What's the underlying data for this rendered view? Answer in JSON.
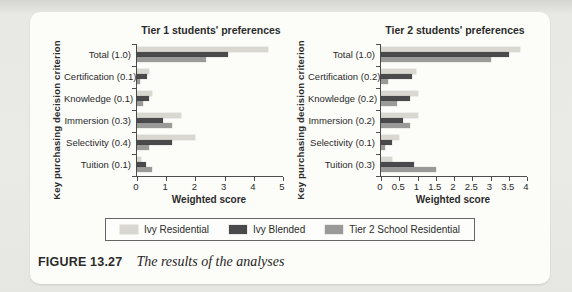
{
  "figure": {
    "label": "FIGURE 13.27",
    "caption": "The results of the analyses"
  },
  "legend": {
    "items": [
      {
        "label": "Ivy Residential",
        "color": "#d8d8d1"
      },
      {
        "label": "Ivy Blended",
        "color": "#4a4a4c"
      },
      {
        "label": "Tier 2 School Residential",
        "color": "#9a9a98"
      }
    ]
  },
  "colors": {
    "page_background": "#e8e9e4",
    "card_background": "#fcfcf9",
    "axis": "#4e4e4e",
    "text": "#2b2b2b"
  },
  "chart_data": [
    {
      "type": "bar",
      "orientation": "horizontal",
      "title": "Tier 1 students' preferences",
      "xlabel": "Weighted score",
      "ylabel": "Key purchasing decision criterion",
      "xlim": [
        0,
        5
      ],
      "xticks": [
        0,
        1,
        2,
        3,
        4,
        5
      ],
      "grid": false,
      "categories": [
        "Total (1.0)",
        "Certification (0.1)",
        "Knowledge (0.1)",
        "Immersion (0.3)",
        "Selectivity (0.4)",
        "Tuition (0.1)"
      ],
      "series": [
        {
          "name": "Ivy Residential",
          "color": "#d8d8d1",
          "values": [
            4.5,
            0.4,
            0.5,
            1.5,
            2.0,
            0.15
          ]
        },
        {
          "name": "Ivy Blended",
          "color": "#4a4a4c",
          "values": [
            3.1,
            0.35,
            0.4,
            0.9,
            1.2,
            0.3
          ]
        },
        {
          "name": "Tier 2 School Residential",
          "color": "#9a9a98",
          "values": [
            2.35,
            0.1,
            0.2,
            1.2,
            0.4,
            0.5
          ]
        }
      ]
    },
    {
      "type": "bar",
      "orientation": "horizontal",
      "title": "Tier 2 students' preferences",
      "xlabel": "Weighted score",
      "ylabel": "Key purchasing decision criterion",
      "xlim": [
        0,
        4
      ],
      "xticks": [
        0,
        0.5,
        1,
        1.5,
        2,
        2.5,
        3,
        3.5,
        4
      ],
      "grid": false,
      "categories": [
        "Total (1.0)",
        "Certification (0.2)",
        "Knowledge (0.2)",
        "Immersion (0.2)",
        "Selectivity (0.1)",
        "Tuition (0.3)"
      ],
      "series": [
        {
          "name": "Ivy Residential",
          "color": "#d8d8d1",
          "values": [
            3.8,
            0.95,
            1.0,
            1.0,
            0.5,
            0.3
          ]
        },
        {
          "name": "Ivy Blended",
          "color": "#4a4a4c",
          "values": [
            3.5,
            0.85,
            0.8,
            0.6,
            0.3,
            0.9
          ]
        },
        {
          "name": "Tier 2 School Residential",
          "color": "#9a9a98",
          "values": [
            3.0,
            0.2,
            0.45,
            0.8,
            0.1,
            1.5
          ]
        }
      ]
    }
  ]
}
